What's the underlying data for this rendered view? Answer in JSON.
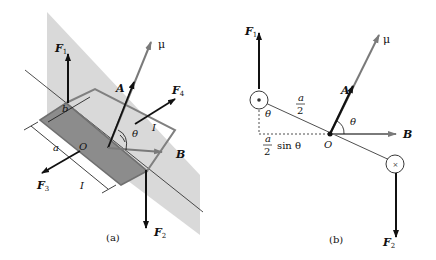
{
  "figure_a": {
    "caption": "(a)",
    "labels": {
      "F1": "F",
      "F1_sub": "1",
      "F2": "F",
      "F2_sub": "2",
      "F3": "F",
      "F3_sub": "3",
      "F4": "F",
      "F4_sub": "4",
      "mu": "μ",
      "A": "A",
      "B": "B",
      "O": "O",
      "theta": "θ",
      "a": "a",
      "b": "b",
      "I_top": "I",
      "I_bottom": "I"
    }
  },
  "figure_b": {
    "caption": "(b)",
    "labels": {
      "F1": "F",
      "F1_sub": "1",
      "F2": "F",
      "F2_sub": "2",
      "mu": "μ",
      "A": "A",
      "B": "B",
      "O": "O",
      "theta_left": "θ",
      "theta_right": "θ",
      "half_a_num": "a",
      "half_a_den": "2",
      "half_sin_num": "a",
      "half_sin_den": "2",
      "sin_theta": "sin θ",
      "current_out": "•",
      "current_in": "×"
    }
  },
  "colors": {
    "plane_shade": "#d9d9d9",
    "loop_fill": "#8c8c8c",
    "loop_edge": "#808080",
    "arrow_dark": "#111111",
    "arrow_gray": "#7a7a7a"
  }
}
